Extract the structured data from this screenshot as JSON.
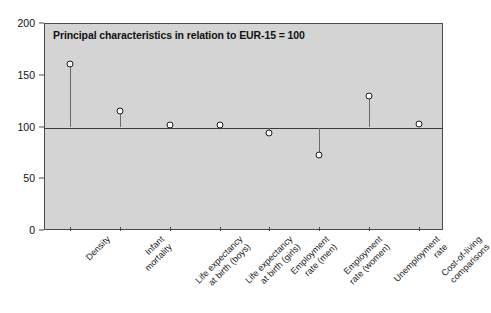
{
  "chart_data": {
    "type": "scatter",
    "title": "Principal characteristics in relation to EUR-15 = 100",
    "xlabel": "",
    "ylabel": "",
    "ylim": [
      0,
      200
    ],
    "yticks": [
      0,
      50,
      100,
      150,
      200
    ],
    "baseline": 100,
    "grid": false,
    "legend": null,
    "categories": [
      "Density",
      "Infant mortality",
      "Life expectancy at birth (boys)",
      "Life expectancy at birth (girls)",
      "Employment rate (men)",
      "Employment rate (women)",
      "Unemployment rate",
      "Cost-of-living comparisons"
    ],
    "category_lines": [
      [
        "Density"
      ],
      [
        "Infant",
        "mortality"
      ],
      [
        "Life expectancy",
        "at birth (boys)"
      ],
      [
        "Life expectancy",
        "at birth (girls)"
      ],
      [
        "Employment",
        "rate (men)"
      ],
      [
        "Employment",
        "rate (women)"
      ],
      [
        "Unemployment",
        "rate"
      ],
      [
        "Cost-of-living",
        "comparisons"
      ]
    ],
    "values": [
      161,
      116,
      102,
      102,
      95,
      73,
      130,
      103
    ]
  },
  "style": {
    "plot_background": "#d4d4d4",
    "page_background": "#ffffff",
    "axis_color": "#4a4a4a",
    "stem_color": "#6a6a6a",
    "marker_fill": "#ffffff",
    "marker_edge": "#1a1a1a",
    "text_color": "#111111"
  }
}
